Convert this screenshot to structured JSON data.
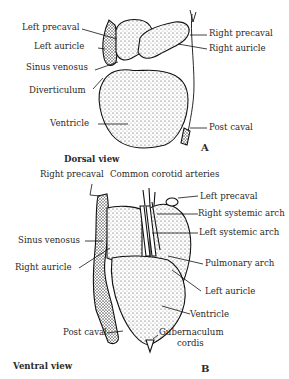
{
  "figure": {
    "panel_a": {
      "letter": "A",
      "caption": "Dorsal view",
      "labels": {
        "left_precaval": "Left precaval",
        "left_auricle": "Left auricle",
        "sinus_venosus": "Sinus venosus",
        "diverticulum": "Diverticulum",
        "ventricle": "Ventricle",
        "right_precaval": "Right precaval",
        "right_auricle": "Right auricle",
        "post_caval": "Post caval"
      }
    },
    "panel_b": {
      "letter": "B",
      "caption": "Ventral view",
      "labels": {
        "right_precaval": "Right precaval",
        "common_carotid": "Common corotid arteries",
        "left_precaval": "Left precaval",
        "right_systemic_arch": "Right systemic arch",
        "left_systemic_arch": "Left systemic arch",
        "sinus_venosus": "Sinus venosus",
        "pulmonary_arch": "Pulmonary arch",
        "right_auricle": "Right auricle",
        "left_auricle": "Left auricle",
        "ventricle": "Ventricle",
        "post_caval": "Post caval",
        "gubernaculum_1": "Gubernaculum",
        "gubernaculum_2": "cordis"
      }
    }
  }
}
